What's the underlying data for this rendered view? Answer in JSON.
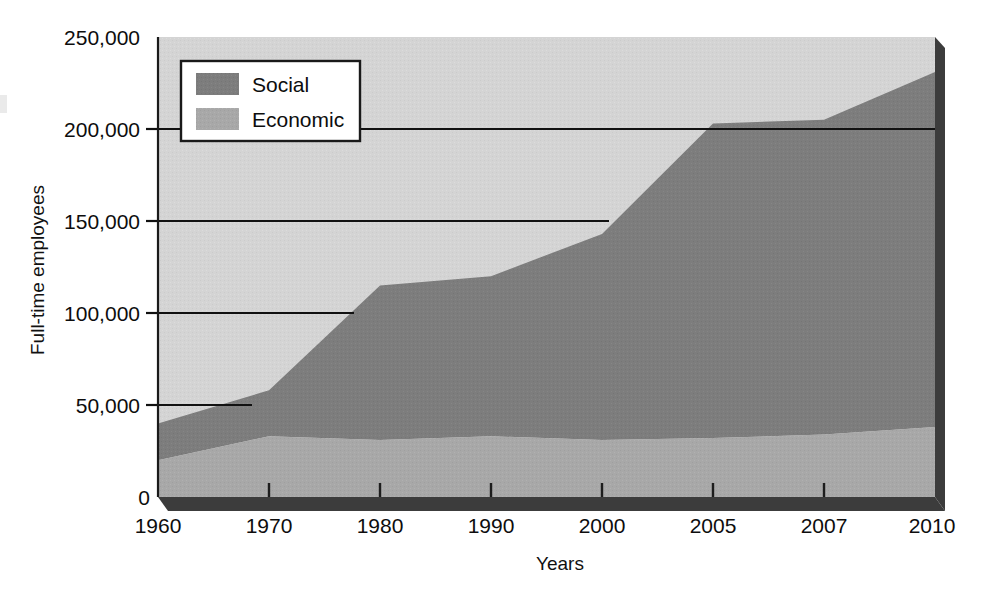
{
  "figure": {
    "background_color": "#ffffff",
    "plot_background_color": "#d4d4d4",
    "shadow_color": "#4a4a4a",
    "axis_color": "#111111"
  },
  "axes": {
    "ylabel": "Full-time employees",
    "xlabel": "Years",
    "y_ticks": [
      "0",
      "50,000",
      "100,000",
      "150,000",
      "200,000",
      "250,000"
    ],
    "y_tick_values": [
      0,
      50000,
      100000,
      150000,
      200000,
      250000
    ],
    "x_ticks": [
      "1960",
      "1970",
      "1980",
      "1990",
      "2000",
      "2005",
      "2007",
      "2010"
    ],
    "ylim": [
      0,
      250000
    ],
    "grid": "horizontal-only"
  },
  "legend": {
    "position": "upper-left-inside",
    "entries": [
      {
        "label": "Social",
        "color": "#7d7d7d"
      },
      {
        "label": "Economic",
        "color": "#a8a8a8"
      }
    ]
  },
  "chart_data": {
    "type": "area",
    "stacked": true,
    "title": "",
    "xlabel": "Years",
    "ylabel": "Full-time employees",
    "ylim": [
      0,
      250000
    ],
    "grid": true,
    "legend_position": "upper-left-inside",
    "categories": [
      "1960",
      "1970",
      "1980",
      "1990",
      "2000",
      "2005",
      "2007",
      "2010"
    ],
    "x": [
      1960,
      1970,
      1980,
      1990,
      2000,
      2005,
      2007,
      2010
    ],
    "series": [
      {
        "name": "Economic",
        "color": "#a8a8a8",
        "values": [
          20000,
          33000,
          31000,
          33000,
          31000,
          32000,
          34000,
          38000
        ]
      },
      {
        "name": "Social",
        "color": "#7d7d7d",
        "values": [
          20000,
          25000,
          84000,
          87000,
          112000,
          171000,
          171000,
          193000
        ]
      }
    ],
    "totals": [
      40000,
      58000,
      115000,
      120000,
      143000,
      203000,
      205000,
      231000
    ]
  },
  "geometry": {
    "plot_left": 158,
    "plot_right": 935,
    "plot_top": 37,
    "plot_bottom": 497,
    "x_pixels": [
      158,
      269,
      380,
      491,
      602,
      713,
      824,
      935
    ],
    "y_pixel_per_unit": 0.00184
  }
}
